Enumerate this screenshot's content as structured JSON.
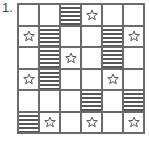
{
  "problem_number": "1.",
  "grid": {
    "rows": 6,
    "cols": 6,
    "legend": {
      "S": "striped",
      "*": "star",
      ".": "empty"
    },
    "cells": [
      [
        ".",
        ".",
        "S",
        "*",
        ".",
        "."
      ],
      [
        "*",
        "S",
        ".",
        ".",
        "S",
        "*"
      ],
      [
        ".",
        "S",
        "*",
        ".",
        "S",
        "."
      ],
      [
        "*",
        "S",
        ".",
        ".",
        "*",
        "."
      ],
      [
        ".",
        ".",
        ".",
        "S",
        ".",
        "S"
      ],
      [
        "S",
        "*",
        ".",
        "*",
        ".",
        "*"
      ]
    ]
  },
  "colors": {
    "grid_line": "#6b6b6b",
    "stripe": "#555555",
    "star_outline": "#444444"
  }
}
